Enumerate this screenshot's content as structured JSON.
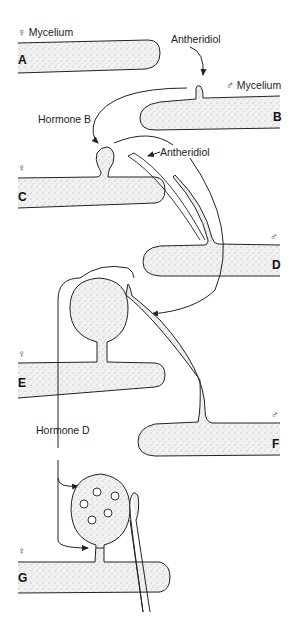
{
  "labels": {
    "female_mycelium": "♀ Mycelium",
    "male_mycelium": "♂ Mycelium",
    "antheridiol_1": "Antheridiol",
    "antheridiol_2": "Antheridiol",
    "hormone_b": "Hormone B",
    "hormone_d": "Hormone D"
  },
  "panels": [
    {
      "id": "A",
      "sex_symbol": "♀",
      "description": "Female mycelium hypha"
    },
    {
      "id": "B",
      "sex_symbol": "♂",
      "description": "Male mycelium with antheridial branch initiated by antheridiol"
    },
    {
      "id": "C",
      "sex_symbol": "♀",
      "description": "Oogonial initial induced by hormone B"
    },
    {
      "id": "D",
      "sex_symbol": "♂",
      "description": "Antheridial hypha grows toward oogonium"
    },
    {
      "id": "E",
      "sex_symbol": "♀",
      "description": "Antheridium contacts oogonium"
    },
    {
      "id": "F",
      "sex_symbol": "♂",
      "description": "Male hypha attached"
    },
    {
      "id": "G",
      "sex_symbol": "♀",
      "description": "Oogonium with eggs, cross-wall formed under hormone D"
    }
  ],
  "symbols": {
    "female": "♀",
    "male": "♂"
  },
  "colors": {
    "line": "#222222",
    "fill": "#ebebeb",
    "background": "#ffffff"
  }
}
